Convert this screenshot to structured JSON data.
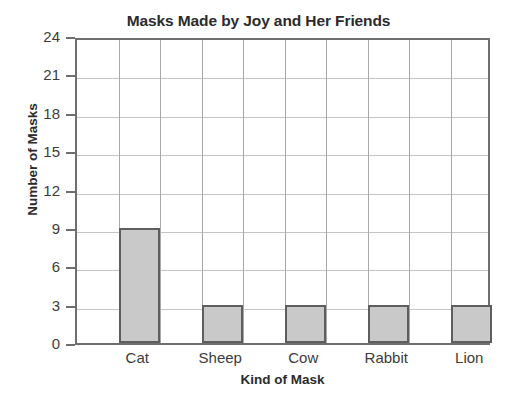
{
  "chart_data": {
    "type": "bar",
    "title": "Masks Made by Joy and Her Friends",
    "xlabel": "Kind of Mask",
    "ylabel": "Number of Masks",
    "categories": [
      "Cat",
      "Sheep",
      "Cow",
      "Rabbit",
      "Lion"
    ],
    "values": [
      9,
      3,
      3,
      3,
      3
    ],
    "ylim": [
      0,
      24
    ],
    "ytick_step": 3,
    "yticks": [
      0,
      3,
      6,
      9,
      12,
      15,
      18,
      21,
      24
    ],
    "ytick_labels": [
      "0",
      "3",
      "6",
      "9",
      "12",
      "15",
      "18",
      "21",
      "24"
    ],
    "grid": true,
    "grid_axis": "both",
    "legend": false,
    "legend_position": "none",
    "bar_fill_color": "#c9c9c9",
    "bar_edge_color": "#5e5e5e",
    "axis_color": "#6e6e6e",
    "gridline_color": "#c4c4c4",
    "text_color": "#2b2b2b",
    "columns_total": 10,
    "bar_columns": [
      2,
      4,
      6,
      8,
      10
    ]
  }
}
